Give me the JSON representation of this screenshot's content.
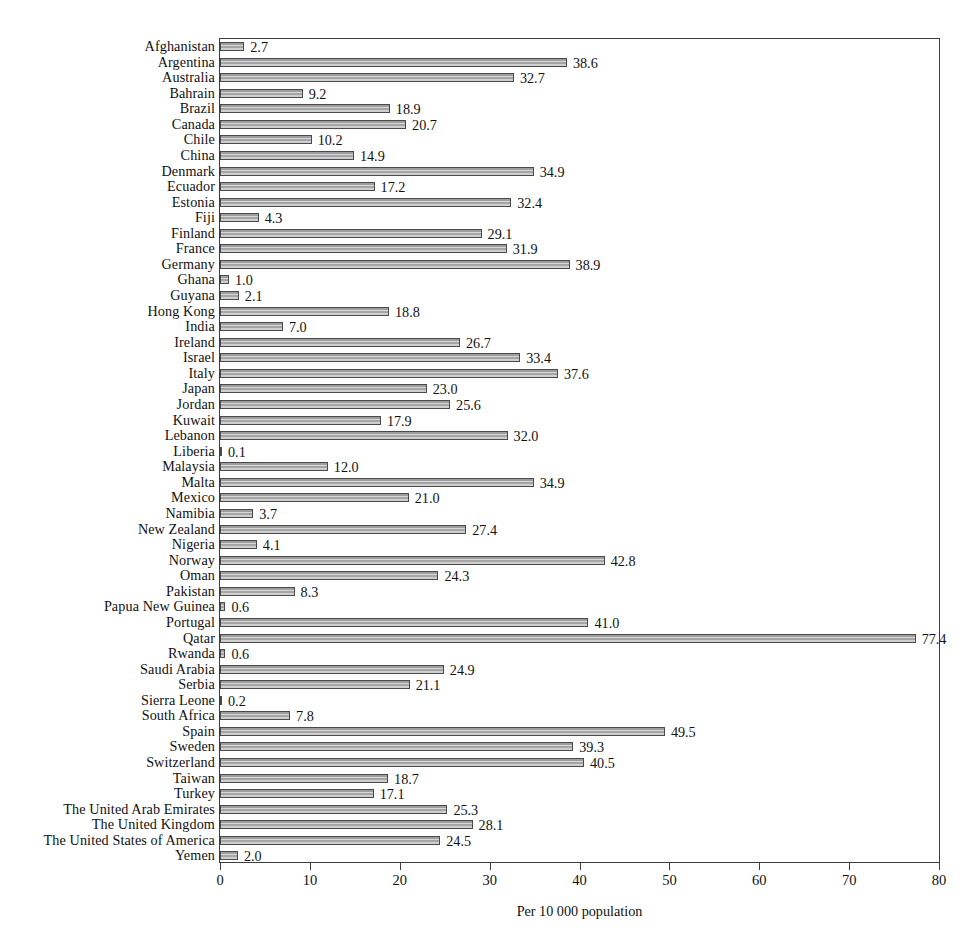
{
  "chart_data": {
    "type": "bar",
    "orientation": "horizontal",
    "title": "",
    "subtitle": "",
    "xlabel": "Per 10 000 population",
    "ylabel": "",
    "xlim": [
      0,
      80
    ],
    "xticks": [
      0,
      10,
      20,
      30,
      40,
      50,
      60,
      70,
      80
    ],
    "xtick_labels": [
      "0",
      "10",
      "20",
      "30",
      "40",
      "50",
      "60",
      "70",
      "80"
    ],
    "grid": false,
    "legend": null,
    "value_label_format": "one-decimal",
    "bar_fill": "#b4b4b4",
    "bar_edge": "#4a4a4a",
    "categories": [
      "Afghanistan",
      "Argentina",
      "Australia",
      "Bahrain",
      "Brazil",
      "Canada",
      "Chile",
      "China",
      "Denmark",
      "Ecuador",
      "Estonia",
      "Fiji",
      "Finland",
      "France",
      "Germany",
      "Ghana",
      "Guyana",
      "Hong Kong",
      "India",
      "Ireland",
      "Israel",
      "Italy",
      "Japan",
      "Jordan",
      "Kuwait",
      "Lebanon",
      "Liberia",
      "Malaysia",
      "Malta",
      "Mexico",
      "Namibia",
      "New Zealand",
      "Nigeria",
      "Norway",
      "Oman",
      "Pakistan",
      "Papua New Guinea",
      "Portugal",
      "Qatar",
      "Rwanda",
      "Saudi Arabia",
      "Serbia",
      "Sierra Leone",
      "South Africa",
      "Spain",
      "Sweden",
      "Switzerland",
      "Taiwan",
      "Turkey",
      "The United Arab Emirates",
      "The United Kingdom",
      "The United States of America",
      "Yemen"
    ],
    "values": [
      2.7,
      38.6,
      32.7,
      9.2,
      18.9,
      20.7,
      10.2,
      14.9,
      34.9,
      17.2,
      32.4,
      4.3,
      29.1,
      31.9,
      38.9,
      1.0,
      2.1,
      18.8,
      7.0,
      26.7,
      33.4,
      37.6,
      23.0,
      25.6,
      17.9,
      32.0,
      0.1,
      12.0,
      34.9,
      21.0,
      3.7,
      27.4,
      4.1,
      42.8,
      24.3,
      8.3,
      0.6,
      41.0,
      77.4,
      0.6,
      24.9,
      21.1,
      0.2,
      7.8,
      49.5,
      39.3,
      40.5,
      18.7,
      17.1,
      25.3,
      28.1,
      24.5,
      2.0
    ],
    "value_labels": [
      "2.7",
      "38.6",
      "32.7",
      "9.2",
      "18.9",
      "20.7",
      "10.2",
      "14.9",
      "34.9",
      "17.2",
      "32.4",
      "4.3",
      "29.1",
      "31.9",
      "38.9",
      "1.0",
      "2.1",
      "18.8",
      "7.0",
      "26.7",
      "33.4",
      "37.6",
      "23.0",
      "25.6",
      "17.9",
      "32.0",
      "0.1",
      "12.0",
      "34.9",
      "21.0",
      "3.7",
      "27.4",
      "4.1",
      "42.8",
      "24.3",
      "8.3",
      "0.6",
      "41.0",
      "77.4",
      "0.6",
      "24.9",
      "21.1",
      "0.2",
      "7.8",
      "49.5",
      "39.3",
      "40.5",
      "18.7",
      "17.1",
      "25.3",
      "28.1",
      "24.5",
      "2.0"
    ]
  }
}
